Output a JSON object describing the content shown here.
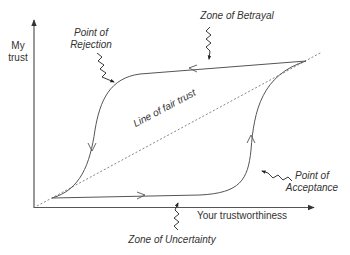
{
  "diagram": {
    "axes": {
      "y_label_line1": "My",
      "y_label_line2": "trust",
      "x_label": "Your trustworthiness"
    },
    "annotations": {
      "point_of_rejection_line1": "Point of",
      "point_of_rejection_line2": "Rejection",
      "zone_of_betrayal": "Zone of Betrayal",
      "line_of_fair_trust": "Line of fair trust",
      "point_of_acceptance_line1": "Point of",
      "point_of_acceptance_line2": "Acceptance",
      "zone_of_uncertainty": "Zone of Uncertainty"
    },
    "colors": {
      "line": "#555555",
      "text": "#333333",
      "dashed": "#777777",
      "background": "#ffffff"
    }
  }
}
